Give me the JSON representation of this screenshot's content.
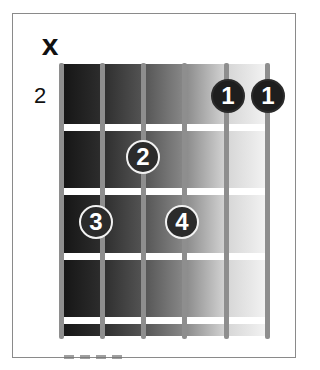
{
  "diagram": {
    "type": "guitar-chord-diagram",
    "muted_marker": "x",
    "start_fret_label": "2",
    "strings": 6,
    "frets_shown": 4,
    "string_positions_x": [
      63,
      104,
      145,
      186,
      228,
      268
    ],
    "fret_lines_y": [
      127,
      191,
      256,
      320
    ],
    "fingers": [
      {
        "label": "1",
        "x": 228,
        "y": 96,
        "style": "solid"
      },
      {
        "label": "1",
        "x": 268,
        "y": 96,
        "style": "solid"
      },
      {
        "label": "2",
        "x": 143,
        "y": 157,
        "style": "outlined"
      },
      {
        "label": "3",
        "x": 96,
        "y": 222,
        "style": "outlined"
      },
      {
        "label": "4",
        "x": 182,
        "y": 222,
        "style": "outlined"
      }
    ],
    "colors": {
      "board_dark": "#151515",
      "board_light": "#f4f4f4",
      "string": "#8e8e8e",
      "fret": "#ffffff",
      "dot": "#2b2b2b",
      "dot_text": "#ffffff"
    }
  }
}
